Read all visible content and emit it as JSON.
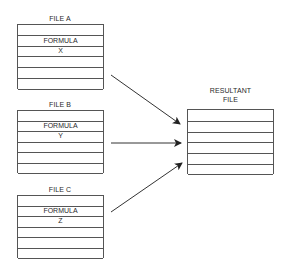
{
  "diagram": {
    "files": [
      {
        "title": "FILE A",
        "row2": "FORMULA",
        "row3": "X"
      },
      {
        "title": "FILE B",
        "row2": "FORMULA",
        "row3": "Y"
      },
      {
        "title": "FILE C",
        "row2": "FORMULA",
        "row3": "Z"
      }
    ],
    "resultant": {
      "title_line1": "RESULTANT",
      "title_line2": "FILE"
    },
    "arrows": [
      {
        "from": "FILE A",
        "to": "RESULTANT FILE"
      },
      {
        "from": "FILE B",
        "to": "RESULTANT FILE"
      },
      {
        "from": "FILE C",
        "to": "RESULTANT FILE"
      }
    ]
  }
}
